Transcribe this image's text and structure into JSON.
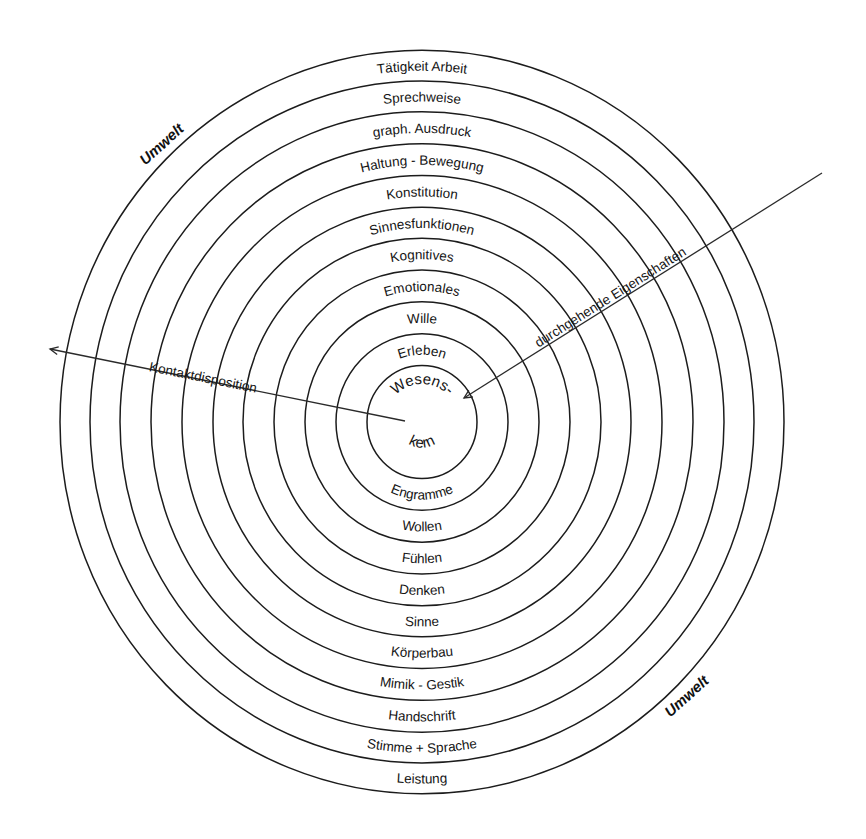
{
  "diagram": {
    "center": {
      "x": 422,
      "y": 422
    },
    "radii": [
      55,
      86,
      117,
      148,
      179,
      209,
      240,
      271,
      302,
      332,
      362
    ],
    "y_scale": 1.027,
    "ring_color": "#1c1c1c",
    "core": {
      "top": "Wesens-",
      "bottom": "kern"
    },
    "upper_labels": [
      "Erleben",
      "Wille",
      "Emotionales",
      "Kognitives",
      "Sinnesfunktionen",
      "Konstitution",
      "Haltung - Bewegung",
      "graph. Ausdruck",
      "Sprechweise",
      "Tätigkeit Arbeit"
    ],
    "lower_labels": [
      "Engramme",
      "Wollen",
      "Fühlen",
      "Denken",
      "Sinne",
      "Körperbau",
      "Mimik - Gestik",
      "Handschrift",
      "Stimme + Sprache",
      "Leistung"
    ],
    "axes": {
      "contact": {
        "label": "Kontaktdisposition",
        "from": [
          405,
          421
        ],
        "to": [
          50,
          349
        ]
      },
      "traits": {
        "label": "durchgehende Eigenschaften",
        "from": [
          822,
          173
        ],
        "to": [
          464,
          398
        ]
      }
    },
    "environment": [
      "Umwelt",
      "Umwelt"
    ]
  }
}
